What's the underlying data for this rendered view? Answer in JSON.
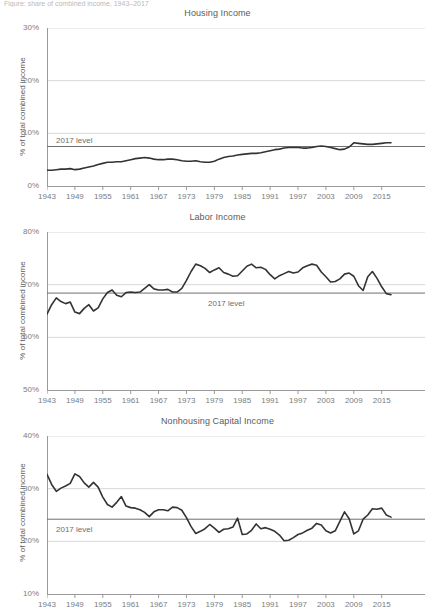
{
  "caption": {
    "text": "Figure: share of combined income, 1943–2017"
  },
  "chart_data": [
    {
      "type": "line",
      "title": "Housing Income",
      "ylabel": "% of total combined income",
      "xlabel": "",
      "ylim": [
        0,
        30
      ],
      "yticks": [
        "0%",
        "10%",
        "20%",
        "30%"
      ],
      "ytick_values": [
        0,
        10,
        20,
        30
      ],
      "xlim": [
        1943,
        2017
      ],
      "xticks": [
        "1943",
        "1949",
        "1955",
        "1961",
        "1967",
        "1973",
        "1979",
        "1985",
        "1991",
        "1997",
        "2003",
        "2009",
        "2015"
      ],
      "xtick_values": [
        1943,
        1949,
        1955,
        1961,
        1967,
        1973,
        1979,
        1985,
        1991,
        1997,
        2003,
        2009,
        2015
      ],
      "grid": true,
      "legend": "none",
      "reference_line": {
        "label": "2017 level",
        "value": 7.5
      },
      "line_color": "#333333",
      "grid_color": "#d8d8d8",
      "series": [
        {
          "name": "Housing Income",
          "x": [
            1943,
            1944,
            1945,
            1946,
            1947,
            1948,
            1949,
            1950,
            1951,
            1952,
            1953,
            1954,
            1955,
            1956,
            1957,
            1958,
            1959,
            1960,
            1961,
            1962,
            1963,
            1964,
            1965,
            1966,
            1967,
            1968,
            1969,
            1970,
            1971,
            1972,
            1973,
            1974,
            1975,
            1976,
            1977,
            1978,
            1979,
            1980,
            1981,
            1982,
            1983,
            1984,
            1985,
            1986,
            1987,
            1988,
            1989,
            1990,
            1991,
            1992,
            1993,
            1994,
            1995,
            1996,
            1997,
            1998,
            1999,
            2000,
            2001,
            2002,
            2003,
            2004,
            2005,
            2006,
            2007,
            2008,
            2009,
            2010,
            2011,
            2012,
            2013,
            2014,
            2015,
            2016,
            2017
          ],
          "values": [
            3.0,
            3.0,
            3.1,
            3.2,
            3.2,
            3.3,
            3.1,
            3.2,
            3.4,
            3.6,
            3.8,
            4.1,
            4.3,
            4.5,
            4.5,
            4.6,
            4.6,
            4.8,
            5.0,
            5.2,
            5.3,
            5.4,
            5.3,
            5.1,
            5.0,
            5.0,
            5.1,
            5.1,
            5.0,
            4.8,
            4.7,
            4.7,
            4.8,
            4.6,
            4.5,
            4.5,
            4.7,
            5.1,
            5.4,
            5.6,
            5.7,
            5.9,
            6.0,
            6.1,
            6.2,
            6.2,
            6.3,
            6.5,
            6.7,
            6.9,
            7.0,
            7.2,
            7.3,
            7.3,
            7.3,
            7.2,
            7.2,
            7.3,
            7.5,
            7.6,
            7.5,
            7.3,
            7.1,
            6.9,
            7.0,
            7.4,
            8.2,
            8.1,
            8.0,
            7.9,
            7.9,
            8.0,
            8.1,
            8.2,
            8.2
          ]
        }
      ]
    },
    {
      "type": "line",
      "title": "Labor Income",
      "ylabel": "% of total combined income",
      "xlabel": "",
      "ylim": [
        50,
        80
      ],
      "yticks": [
        "50%",
        "60%",
        "70%",
        "80%"
      ],
      "ytick_values": [
        50,
        60,
        70,
        80
      ],
      "xlim": [
        1943,
        2017
      ],
      "xticks": [
        "1943",
        "1949",
        "1955",
        "1961",
        "1967",
        "1973",
        "1979",
        "1985",
        "1991",
        "1997",
        "2003",
        "2009",
        "2015"
      ],
      "xtick_values": [
        1943,
        1949,
        1955,
        1961,
        1967,
        1973,
        1979,
        1985,
        1991,
        1997,
        2003,
        2009,
        2015
      ],
      "grid": true,
      "legend": "none",
      "reference_line": {
        "label": "2017 level",
        "value": 68.4
      },
      "line_color": "#333333",
      "grid_color": "#d8d8d8",
      "series": [
        {
          "name": "Labor Income",
          "x": [
            1943,
            1944,
            1945,
            1946,
            1947,
            1948,
            1949,
            1950,
            1951,
            1952,
            1953,
            1954,
            1955,
            1956,
            1957,
            1958,
            1959,
            1960,
            1961,
            1962,
            1963,
            1964,
            1965,
            1966,
            1967,
            1968,
            1969,
            1970,
            1971,
            1972,
            1973,
            1974,
            1975,
            1976,
            1977,
            1978,
            1979,
            1980,
            1981,
            1982,
            1983,
            1984,
            1985,
            1986,
            1987,
            1988,
            1989,
            1990,
            1991,
            1992,
            1993,
            1994,
            1995,
            1996,
            1997,
            1998,
            1999,
            2000,
            2001,
            2002,
            2003,
            2004,
            2005,
            2006,
            2007,
            2008,
            2009,
            2010,
            2011,
            2012,
            2013,
            2014,
            2015,
            2016,
            2017
          ],
          "values": [
            64.4,
            66.2,
            67.5,
            66.8,
            66.4,
            66.7,
            64.8,
            64.5,
            65.5,
            66.2,
            65.0,
            65.6,
            67.3,
            68.5,
            69.0,
            68.0,
            67.7,
            68.5,
            68.6,
            68.5,
            68.6,
            69.3,
            70.0,
            69.2,
            69.0,
            69.0,
            69.1,
            68.6,
            68.6,
            69.3,
            70.8,
            72.5,
            73.9,
            73.6,
            73.1,
            72.3,
            72.8,
            73.2,
            72.3,
            72.0,
            71.6,
            71.7,
            72.6,
            73.5,
            73.9,
            73.2,
            73.3,
            72.9,
            71.9,
            71.1,
            71.7,
            72.1,
            72.5,
            72.2,
            72.4,
            73.2,
            73.6,
            73.9,
            73.7,
            72.4,
            71.5,
            70.5,
            70.6,
            71.1,
            72.0,
            72.2,
            71.6,
            69.8,
            68.9,
            71.5,
            72.5,
            71.2,
            69.6,
            68.3,
            68.1,
            67.9,
            68.4,
            68.1,
            68.9,
            69.2,
            68.9
          ]
        }
      ]
    },
    {
      "type": "line",
      "title": "Nonhousing Capital Income",
      "ylabel": "% of total combined income",
      "xlabel": "",
      "ylim": [
        10,
        40
      ],
      "yticks": [
        "10%",
        "20%",
        "30%",
        "40%"
      ],
      "ytick_values": [
        10,
        20,
        30,
        40
      ],
      "xlim": [
        1943,
        2017
      ],
      "xticks": [
        "1943",
        "1949",
        "1955",
        "1961",
        "1967",
        "1973",
        "1979",
        "1985",
        "1991",
        "1997",
        "2003",
        "2009",
        "2015"
      ],
      "xtick_values": [
        1943,
        1949,
        1955,
        1961,
        1967,
        1973,
        1979,
        1985,
        1991,
        1997,
        2003,
        2009,
        2015
      ],
      "grid": true,
      "legend": "none",
      "reference_line": {
        "label": "2017 level",
        "value": 24.2
      },
      "line_color": "#333333",
      "grid_color": "#d8d8d8",
      "series": [
        {
          "name": "Nonhousing Capital Income",
          "x": [
            1943,
            1944,
            1945,
            1946,
            1947,
            1948,
            1949,
            1950,
            1951,
            1952,
            1953,
            1954,
            1955,
            1956,
            1957,
            1958,
            1959,
            1960,
            1961,
            1962,
            1963,
            1964,
            1965,
            1966,
            1967,
            1968,
            1969,
            1970,
            1971,
            1972,
            1973,
            1974,
            1975,
            1976,
            1977,
            1978,
            1979,
            1980,
            1981,
            1982,
            1983,
            1984,
            1985,
            1986,
            1987,
            1988,
            1989,
            1990,
            1991,
            1992,
            1993,
            1994,
            1995,
            1996,
            1997,
            1998,
            1999,
            2000,
            2001,
            2002,
            2003,
            2004,
            2005,
            2006,
            2007,
            2008,
            2009,
            2010,
            2011,
            2012,
            2013,
            2014,
            2015,
            2016,
            2017
          ],
          "values": [
            32.7,
            30.8,
            29.5,
            30.1,
            30.5,
            31.0,
            32.8,
            32.3,
            31.1,
            30.3,
            31.2,
            30.3,
            28.4,
            27.0,
            26.5,
            27.4,
            28.5,
            26.7,
            26.4,
            26.3,
            26.0,
            25.5,
            24.7,
            25.6,
            26.0,
            26.0,
            25.8,
            26.5,
            26.4,
            25.9,
            24.5,
            22.8,
            21.5,
            21.9,
            22.4,
            23.2,
            22.5,
            21.7,
            22.3,
            22.4,
            22.7,
            24.4,
            21.3,
            21.4,
            22.1,
            23.3,
            22.4,
            22.6,
            22.3,
            21.9,
            21.2,
            20.1,
            20.2,
            20.7,
            21.3,
            21.6,
            22.1,
            22.5,
            23.4,
            23.1,
            22.0,
            21.6,
            22.0,
            23.8,
            25.6,
            24.3,
            21.4,
            22.0,
            24.2,
            25.0,
            26.2,
            26.1,
            26.3,
            25.0,
            24.6
          ]
        }
      ]
    }
  ]
}
